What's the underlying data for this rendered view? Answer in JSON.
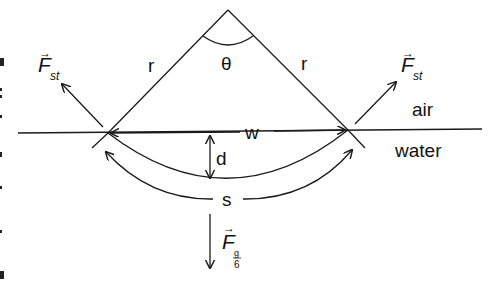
{
  "diagram": {
    "type": "physics-free-body",
    "labels": {
      "theta": "θ",
      "r_left": "r",
      "r_right": "r",
      "force_st_left_main": "F",
      "force_st_left_sub": "st",
      "force_st_right_main": "F",
      "force_st_right_sub": "st",
      "air": "air",
      "water": "water",
      "width": "w",
      "depth": "d",
      "arc_length": "s",
      "force_g_main": "F",
      "force_g_num": "g",
      "force_g_den": "6"
    },
    "colors": {
      "stroke": "#1a1a1a",
      "background": "#ffffff"
    }
  }
}
